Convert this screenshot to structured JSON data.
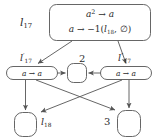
{
  "figure": {
    "width": 156,
    "height": 139,
    "background": "#ffffff",
    "stroke_color": "#555555",
    "text_color": "#2b2b2b"
  },
  "rule_box": {
    "name": "rule-box",
    "label": "l",
    "label_sub": "17",
    "line1": "a² → a",
    "line2": "a → −1(l₁₈, ∅)",
    "line1_parts": {
      "lhs": "a",
      "lhs_sup": "2",
      "arrow": "→",
      "rhs": "a"
    },
    "line2_parts": {
      "lhs": "a",
      "arrow": "→",
      "rhs_prefix": "−1(",
      "rhs_l": "l",
      "rhs_l_sub": "18",
      "rhs_sep": ", ",
      "rhs_empty": "∅",
      "rhs_suffix": ")"
    }
  },
  "nodes": {
    "left": {
      "id": "node-left",
      "label": "l",
      "label_sub": "17",
      "label_prime": "′",
      "text": "a → a",
      "text_parts": {
        "lhs": "a",
        "arrow": "→",
        "rhs": "a"
      },
      "shape": "stadium"
    },
    "center": {
      "id": "node-center",
      "label": "2",
      "text": "",
      "shape": "rounded-rect"
    },
    "right": {
      "id": "node-right",
      "label": "l",
      "label_sub": "17",
      "label_prime": "″",
      "text": "a → a",
      "text_parts": {
        "lhs": "a",
        "arrow": "→",
        "rhs": "a"
      },
      "shape": "stadium"
    },
    "bottom_left": {
      "id": "node-bottom-left",
      "label": "l",
      "label_sub": "18",
      "text": "",
      "shape": "rounded-rect"
    },
    "bottom_right": {
      "id": "node-bottom-right",
      "label": "3",
      "text": "",
      "shape": "rounded-rect"
    }
  },
  "edges": [
    {
      "name": "edge-rule-to-left",
      "from": "rule-box",
      "to": "node-left",
      "kind": "arrow"
    },
    {
      "name": "edge-rule-to-right",
      "from": "rule-box",
      "to": "node-right",
      "kind": "arrow"
    },
    {
      "name": "edge-left-to-center",
      "from": "node-left",
      "to": "node-center",
      "kind": "arrow"
    },
    {
      "name": "edge-right-to-center",
      "from": "node-right",
      "to": "node-center",
      "kind": "arrow"
    },
    {
      "name": "edge-left-to-bottom-left",
      "from": "node-left",
      "to": "node-bottom-left",
      "kind": "arrow"
    },
    {
      "name": "edge-left-to-bottom-right",
      "from": "node-left",
      "to": "node-bottom-right",
      "kind": "arrow"
    },
    {
      "name": "edge-right-to-bottom-left",
      "from": "node-right",
      "to": "node-bottom-left",
      "kind": "arrow"
    },
    {
      "name": "edge-right-to-bottom-right",
      "from": "node-right",
      "to": "node-bottom-right",
      "kind": "arrow"
    }
  ]
}
